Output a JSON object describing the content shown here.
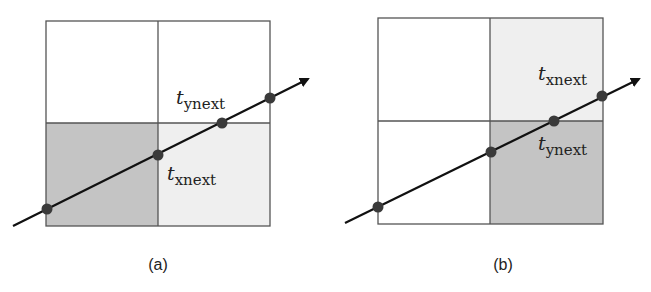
{
  "colors": {
    "dark_cell": "#c4c4c4",
    "light_cell": "#efefef",
    "white_cell": "#ffffff",
    "grid_line": "#555555",
    "ray": "#111111",
    "point": "#3a3a3a"
  },
  "panels": [
    {
      "caption": "(a)",
      "labels": {
        "upper": {
          "main": "t",
          "sub": "ynext"
        },
        "lower": {
          "main": "t",
          "sub": "xnext"
        }
      },
      "shading": {
        "top_left": "white",
        "top_right": "white",
        "bottom_left": "dark",
        "bottom_right": "light"
      }
    },
    {
      "caption": "(b)",
      "labels": {
        "upper": {
          "main": "t",
          "sub": "xnext"
        },
        "lower": {
          "main": "t",
          "sub": "ynext"
        }
      },
      "shading": {
        "top_left": "white",
        "top_right": "light",
        "bottom_left": "white",
        "bottom_right": "dark"
      }
    }
  ]
}
